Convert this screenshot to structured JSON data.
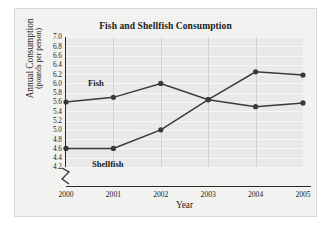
{
  "chart_data": {
    "type": "line",
    "title": "Fish and Shellfish Consumption",
    "xlabel": "Year",
    "ylabel": "Annual Consumption",
    "ylabel_sub": "(pounds per person)",
    "categories": [
      "2000",
      "2001",
      "2002",
      "2003",
      "2004",
      "2005"
    ],
    "x": [
      2000,
      2001,
      2002,
      2003,
      2004,
      2005
    ],
    "ylim": [
      4.2,
      7.0
    ],
    "ytick_step": 0.2,
    "yticks": [
      "7.0",
      "6.8",
      "6.6",
      "6.4",
      "6.2",
      "6.0",
      "5.8",
      "5.6",
      "5.4",
      "5.2",
      "5.0",
      "4.8",
      "4.6",
      "4.4",
      "4.2"
    ],
    "ytick_values": [
      7.0,
      6.8,
      6.6,
      6.4,
      6.2,
      6.0,
      5.8,
      5.6,
      5.4,
      5.2,
      5.0,
      4.8,
      4.6,
      4.4,
      4.2
    ],
    "grid": true,
    "grid_orientation": "horizontal-and-vertical",
    "legend_position": "inline-labels",
    "axis_break": "y-axis below 4.2",
    "series": [
      {
        "name": "Fish",
        "color": "#3a3a3a",
        "values": [
          5.6,
          5.7,
          6.0,
          5.65,
          5.5,
          5.58
        ]
      },
      {
        "name": "Shellfish",
        "color": "#3a3a3a",
        "values": [
          4.6,
          4.6,
          5.0,
          5.65,
          6.25,
          6.18
        ]
      }
    ],
    "annotations": [
      {
        "text": "Fish",
        "near": "fish-line-left"
      },
      {
        "text": "Shellfish",
        "near": "shellfish-line-left"
      }
    ]
  },
  "colors": {
    "figure_background": "#f2f2f1",
    "plot_background": "#e9e9e7",
    "gridline": "#f7f7f6",
    "axis": "#2b2b2b",
    "series": "#3a3a3a",
    "text": "#1a1a1a"
  }
}
